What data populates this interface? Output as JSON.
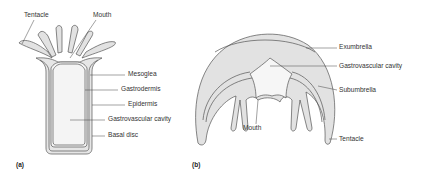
{
  "figure": {
    "panel_a": {
      "tag": "(a)",
      "title": "Polyp",
      "labels": {
        "tentacle": "Tentacle",
        "mouth": "Mouth",
        "mesoglea": "Mesoglea",
        "gastrodermis": "Gastrodermis",
        "epidermis": "Epidermis",
        "gastrovascular_cavity": "Gastrovascular cavity",
        "basal_disc": "Basal disc"
      }
    },
    "panel_b": {
      "tag": "(b)",
      "title": "Medusa",
      "labels": {
        "exumbrella": "Exumbrella",
        "gastrovascular_cavity": "Gastrovascular cavity",
        "subumbrella": "Subumbrella",
        "mouth": "Mouth",
        "tentacle": "Tentacle"
      }
    },
    "colors": {
      "outline": "#555555",
      "fill": "#e2e2e2",
      "cavity": "#f4f4f4",
      "leader": "#444444",
      "text": "#333333"
    }
  }
}
